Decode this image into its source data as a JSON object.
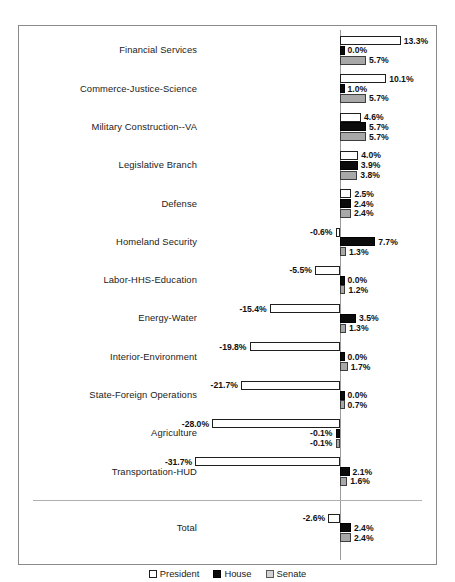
{
  "chart_data": {
    "type": "bar",
    "orientation": "horizontal",
    "title": "",
    "xlabel": "",
    "ylabel": "",
    "grid": false,
    "zero_reference_line": true,
    "legend_position": "bottom",
    "value_suffix": "%",
    "xlim": [
      -34,
      16
    ],
    "categories": [
      "Financial Services",
      "Commerce-Justice-Science",
      "Military Construction--VA",
      "Legislative Branch",
      "Defense",
      "Homeland Security",
      "Labor-HHS-Education",
      "Energy-Water",
      "Interior-Environment",
      "State-Foreign Operations",
      "Agriculture",
      "Transportation-HUD"
    ],
    "total_label": "Total",
    "series": [
      {
        "name": "President",
        "color": "#ffffff",
        "values": [
          13.3,
          10.1,
          4.6,
          4.0,
          2.5,
          -0.6,
          -5.5,
          -15.4,
          -19.8,
          -21.7,
          -28.0,
          -31.7
        ],
        "total": -2.6,
        "labels": [
          "13.3%",
          "10.1%",
          "4.6%",
          "4.0%",
          "2.5%",
          "-0.6%",
          "-5.5%",
          "-15.4%",
          "-19.8%",
          "-21.7%",
          "-28.0%",
          "-31.7%"
        ],
        "total_label_text": "-2.6%"
      },
      {
        "name": "House",
        "color": "#0b0b0b",
        "values": [
          0.0,
          1.0,
          5.7,
          3.9,
          2.4,
          7.7,
          0.0,
          3.5,
          0.0,
          0.0,
          -0.1,
          2.1
        ],
        "total": 2.4,
        "labels": [
          "0.0%",
          "1.0%",
          "5.7%",
          "3.9%",
          "2.4%",
          "7.7%",
          "0.0%",
          "3.5%",
          "0.0%",
          "0.0%",
          "-0.1%",
          "2.1%"
        ],
        "total_label_text": "2.4%"
      },
      {
        "name": "Senate",
        "color": "#a8a8a8",
        "values": [
          5.7,
          5.7,
          5.7,
          3.8,
          2.4,
          1.3,
          1.2,
          1.3,
          1.7,
          0.7,
          -0.1,
          1.6
        ],
        "total": 2.4,
        "labels": [
          "5.7%",
          "5.7%",
          "5.7%",
          "3.8%",
          "2.4%",
          "1.3%",
          "1.2%",
          "1.3%",
          "1.7%",
          "0.7%",
          "-0.1%",
          "1.6%"
        ],
        "total_label_text": "2.4%"
      }
    ]
  },
  "legend": {
    "items": [
      {
        "label": "President",
        "key": "president"
      },
      {
        "label": "House",
        "key": "house"
      },
      {
        "label": "Senate",
        "key": "senate"
      }
    ]
  }
}
